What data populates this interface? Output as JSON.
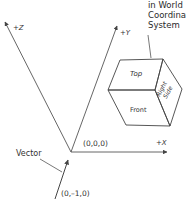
{
  "diagram": {
    "caption_lines": [
      "in World",
      "Coordinate",
      "System"
    ],
    "axes": {
      "z": {
        "label": "+Z"
      },
      "y": {
        "label": "+Y"
      },
      "x": {
        "label": "+X"
      }
    },
    "origin": {
      "label": "(0,0,0)"
    },
    "vector": {
      "label": "Vector",
      "value_label": "(0,–1,0)"
    },
    "cube": {
      "faces": {
        "top": "Top",
        "front": "Front",
        "right_line1": "Right",
        "right_line2": "Side"
      }
    },
    "colors": {
      "line": "#555555",
      "text": "#333333",
      "background": "#ffffff"
    }
  }
}
